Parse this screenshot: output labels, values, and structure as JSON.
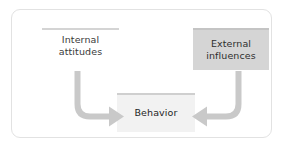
{
  "diagram": {
    "type": "flow-diagram",
    "title": "",
    "colors": {
      "card_border": "#e2e2e2",
      "background": "#ffffff",
      "arrow": "#c9c9c9",
      "external_fill": "#d5d5d5",
      "behavior_fill": "#f2f2f2",
      "rule": "#d4d4d4",
      "text": "#2e2e2e"
    },
    "nodes": [
      {
        "id": "internal-attitudes",
        "label_line1": "Internal",
        "label_line2": "attitudes",
        "style": "underlined-text"
      },
      {
        "id": "external-influences",
        "label_line1": "External",
        "label_line2": "influences",
        "style": "filled-gray-box"
      },
      {
        "id": "behavior",
        "label_line1": "Behavior",
        "style": "light-box"
      }
    ],
    "arrows": [
      {
        "id": "internal-to-behavior",
        "from": "internal-attitudes",
        "to": "behavior",
        "shape": "elbow-down-right",
        "direction": "right"
      },
      {
        "id": "external-to-behavior",
        "from": "external-influences",
        "to": "behavior",
        "shape": "elbow-down-left",
        "direction": "left"
      }
    ]
  }
}
